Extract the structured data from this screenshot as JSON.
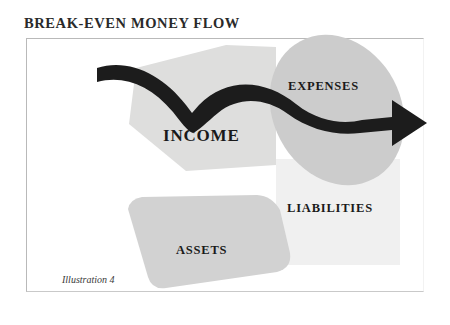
{
  "title": "BREAK-EVEN MONEY FLOW",
  "caption": "Illustration 4",
  "colors": {
    "background": "#ffffff",
    "frame_border": "#b9b9b9",
    "income_shape": "#dededd",
    "expenses_shape": "#cccccc",
    "assets_shape": "#d2d2d2",
    "liabilities_shape": "#f0f0f0",
    "arrow": "#1c1c1c",
    "text": "#1a1a1a"
  },
  "diagram": {
    "type": "money-flow",
    "nodes": [
      {
        "id": "income",
        "label": "INCOME",
        "shape": "polygon",
        "fill": "#dededd"
      },
      {
        "id": "expenses",
        "label": "EXPENSES",
        "shape": "ellipse",
        "fill": "#cccccc"
      },
      {
        "id": "liabilities",
        "label": "LIABILITIES",
        "shape": "rectangle",
        "fill": "#f0f0f0"
      },
      {
        "id": "assets",
        "label": "ASSETS",
        "shape": "blob",
        "fill": "#d2d2d2"
      }
    ],
    "flow": {
      "from": "income",
      "to": "expenses",
      "style": "curved-thick-arrow",
      "direction": "left-to-right"
    }
  }
}
